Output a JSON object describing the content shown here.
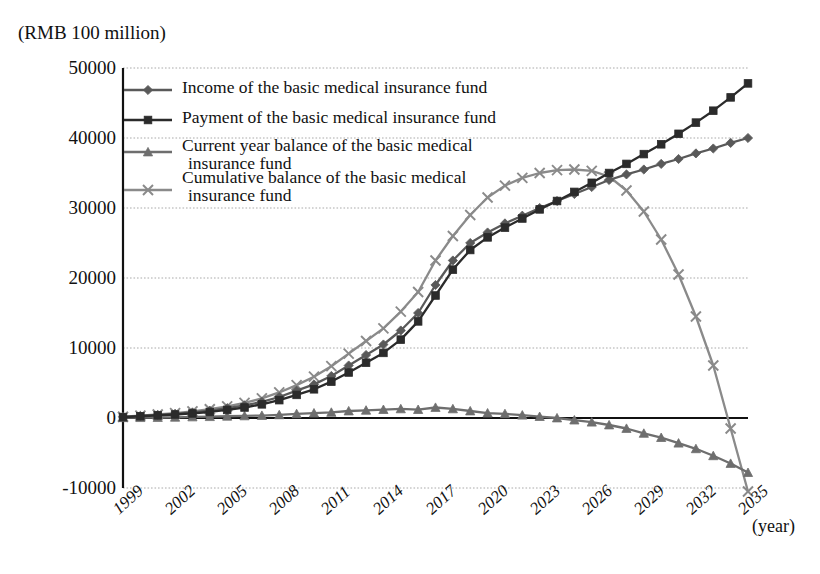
{
  "unit_caption": "(RMB 100 million)",
  "x_axis_unit": "(year)",
  "legend": [
    {
      "label": "Income of the basic medical insurance fund",
      "marker": "diamond-marker-icon",
      "color": "#595959"
    },
    {
      "label": "Payment of the basic medical insurance fund",
      "marker": "square-marker-icon",
      "color": "#2b2b2b"
    },
    {
      "label_line1": "Current year balance of the basic medical",
      "label_line2": "insurance fund",
      "marker": "triangle-marker-icon",
      "color": "#6e6e6e"
    },
    {
      "label_line1": "Cumulative balance of the basic medical",
      "label_line2": "insurance fund",
      "marker": "cross-marker-icon",
      "color": "#8a8a8a"
    }
  ],
  "chart_data": {
    "type": "line",
    "title": "",
    "subtitle": "",
    "xlabel": "(year)",
    "ylabel": "(RMB 100 million)",
    "xlim": [
      1999,
      2035
    ],
    "ylim": [
      -10000,
      50000
    ],
    "ytick_labels": [
      "50000",
      "40000",
      "30000",
      "20000",
      "10000",
      "0",
      "-10000"
    ],
    "yticks": [
      50000,
      40000,
      30000,
      20000,
      10000,
      0,
      -10000
    ],
    "xtick_labels": [
      "1999",
      "2002",
      "2005",
      "2008",
      "2011",
      "2014",
      "2017",
      "2020",
      "2023",
      "2026",
      "2029",
      "2032",
      "2035"
    ],
    "xticks": [
      1999,
      2002,
      2005,
      2008,
      2011,
      2014,
      2017,
      2020,
      2023,
      2026,
      2029,
      2032,
      2035
    ],
    "grid": true,
    "grid_style": "dotted-horizontal",
    "zero_line": true,
    "legend_position": "inside-top-left",
    "x": [
      1999,
      2000,
      2001,
      2002,
      2003,
      2004,
      2005,
      2006,
      2007,
      2008,
      2009,
      2010,
      2011,
      2012,
      2013,
      2014,
      2015,
      2016,
      2017,
      2018,
      2019,
      2020,
      2021,
      2022,
      2023,
      2024,
      2025,
      2026,
      2027,
      2028,
      2029,
      2030,
      2031,
      2032,
      2033,
      2034,
      2035
    ],
    "series": [
      {
        "name": "Income of the basic medical insurance fund",
        "color": "#595959",
        "marker": "diamond",
        "values": [
          170,
          300,
          450,
          600,
          800,
          1050,
          1400,
          1800,
          2300,
          3000,
          3900,
          4800,
          6000,
          7500,
          9000,
          10500,
          12500,
          15000,
          19000,
          22500,
          25000,
          26500,
          27800,
          28900,
          30000,
          31000,
          32000,
          33000,
          34000,
          34800,
          35500,
          36300,
          37000,
          37800,
          38500,
          39300,
          40000
        ]
      },
      {
        "name": "Payment of the basic medical insurance fund",
        "color": "#2b2b2b",
        "marker": "square",
        "values": [
          130,
          250,
          380,
          500,
          650,
          860,
          1150,
          1500,
          1950,
          2550,
          3300,
          4100,
          5200,
          6500,
          7900,
          9300,
          11200,
          13800,
          17500,
          21200,
          24000,
          25800,
          27200,
          28500,
          29800,
          31000,
          32300,
          33600,
          35000,
          36300,
          37700,
          39100,
          40600,
          42200,
          43900,
          45800,
          47800
        ]
      },
      {
        "name": "Current year balance of the basic medical insurance fund",
        "color": "#6e6e6e",
        "marker": "triangle",
        "values": [
          40,
          50,
          70,
          100,
          150,
          190,
          250,
          300,
          350,
          450,
          600,
          700,
          800,
          1000,
          1100,
          1200,
          1300,
          1200,
          1500,
          1300,
          1000,
          700,
          600,
          400,
          200,
          0,
          -300,
          -600,
          -1000,
          -1500,
          -2200,
          -2800,
          -3600,
          -4400,
          -5400,
          -6500,
          -7800
        ]
      },
      {
        "name": "Cumulative balance of the basic medical insurance fund",
        "color": "#8a8a8a",
        "marker": "cross",
        "values": [
          180,
          330,
          500,
          700,
          950,
          1250,
          1650,
          2150,
          2800,
          3650,
          4700,
          5900,
          7400,
          9200,
          11000,
          12800,
          15200,
          18000,
          22500,
          26000,
          29000,
          31500,
          33200,
          34300,
          35000,
          35400,
          35500,
          35300,
          34500,
          32500,
          29500,
          25500,
          20500,
          14500,
          7500,
          -1500,
          -10500
        ]
      }
    ]
  }
}
